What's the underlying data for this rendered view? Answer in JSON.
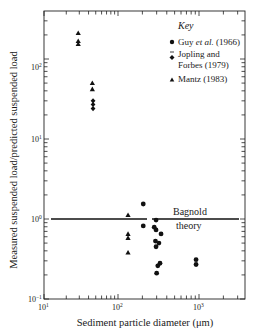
{
  "chart_data": {
    "type": "scatter",
    "title": "",
    "xlabel": "Sediment particle diameter (μm)",
    "ylabel": "Measured suspended load/predicted suspended load",
    "xscale": "log",
    "yscale": "log",
    "xlim": [
      10,
      4000
    ],
    "ylim": [
      0.1,
      350
    ],
    "x_ticks": [
      "10¹",
      "10²",
      "10³"
    ],
    "y_ticks": [
      "10⁻¹",
      "10⁰",
      "10¹",
      "10²"
    ],
    "grid": false,
    "legend": {
      "title": "Key",
      "position": "upper right",
      "entries": [
        {
          "label": "Guy et al. (1966)",
          "marker": "circle"
        },
        {
          "label": "Jopling and Forbes (1979)",
          "marker": "diamond"
        },
        {
          "label": "Mantz (1983)",
          "marker": "triangle"
        }
      ]
    },
    "reference_line": {
      "label": "Bagnold theory",
      "y": 1.0,
      "x_range": [
        12,
        3500
      ]
    },
    "series": [
      {
        "name": "Guy et al. (1966)",
        "marker": "circle",
        "points": [
          [
            205,
            1.54
          ],
          [
            205,
            0.82
          ],
          [
            295,
            0.97
          ],
          [
            280,
            0.79
          ],
          [
            295,
            0.73
          ],
          [
            340,
            0.65
          ],
          [
            290,
            0.53
          ],
          [
            320,
            0.5
          ],
          [
            295,
            0.45
          ],
          [
            330,
            0.28
          ],
          [
            310,
            0.26
          ],
          [
            300,
            0.21
          ],
          [
            920,
            0.31
          ],
          [
            920,
            0.27
          ]
        ]
      },
      {
        "name": "Jopling and Forbes (1979)",
        "marker": "diamond",
        "points": [
          [
            46,
            30
          ],
          [
            46,
            27
          ],
          [
            46,
            24
          ]
        ]
      },
      {
        "name": "Mantz (1983)",
        "marker": "triangle",
        "points": [
          [
            29,
            211
          ],
          [
            29,
            168
          ],
          [
            29,
            154
          ],
          [
            45,
            50
          ],
          [
            45,
            42
          ],
          [
            133,
            1.12
          ],
          [
            133,
            0.65
          ],
          [
            133,
            0.58
          ],
          [
            133,
            0.38
          ]
        ]
      }
    ]
  },
  "labels": {
    "xlabel": "Sediment particle diameter (μm)",
    "ylabel": "Measured suspended load/predicted suspended load",
    "key_title": "Key",
    "legend_guy_a": "Guy ",
    "legend_guy_b": "et al.",
    "legend_guy_c": " (1966)",
    "legend_jf_1": "Jopling and",
    "legend_jf_2": "Forbes (1979)",
    "legend_mantz": "Mantz (1983)",
    "bagnold_1": "Bagnold",
    "bagnold_2": "theory",
    "xtick_base": "10",
    "xtick_1": "1",
    "xtick_2": "2",
    "xtick_3": "3",
    "ytick_m1": "−1",
    "ytick_0": "0",
    "ytick_1": "1",
    "ytick_2": "2"
  }
}
